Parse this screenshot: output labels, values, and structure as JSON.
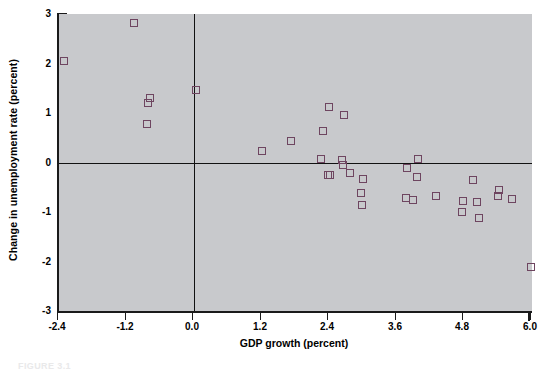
{
  "chart_data": {
    "type": "scatter",
    "title": "",
    "xlabel": "GDP growth (percent)",
    "ylabel": "Change in unemployment rate (percent)",
    "xlim": [
      -2.4,
      6.0
    ],
    "ylim": [
      -3,
      3
    ],
    "xticks": [
      "-2.4",
      "-1.2",
      "0.0",
      "1.2",
      "2.4",
      "3.6",
      "4.8",
      "6.0"
    ],
    "xtick_values": [
      -2.4,
      -1.2,
      0.0,
      1.2,
      2.4,
      3.6,
      4.8,
      6.0
    ],
    "yticks": [
      "3",
      "2",
      "1",
      "0",
      "-1",
      "-2",
      "-3"
    ],
    "ytick_values": [
      3,
      2,
      1,
      0,
      -1,
      -2,
      -3
    ],
    "grid": false,
    "legend": null,
    "marker_style": "open-square",
    "marker_color": "#6e4560",
    "plot_background": "#c8c9cc",
    "reference_lines": [
      {
        "axis": "y",
        "value": 0
      },
      {
        "axis": "x",
        "value": 0
      }
    ],
    "points": [
      {
        "x": -2.32,
        "y": 2.06
      },
      {
        "x": -1.06,
        "y": 2.82
      },
      {
        "x": -0.78,
        "y": 1.3
      },
      {
        "x": -0.82,
        "y": 1.21
      },
      {
        "x": -0.83,
        "y": 0.77
      },
      {
        "x": 0.03,
        "y": 1.47
      },
      {
        "x": 1.2,
        "y": 0.24
      },
      {
        "x": 1.72,
        "y": 0.43
      },
      {
        "x": 2.28,
        "y": 0.64
      },
      {
        "x": 2.4,
        "y": 1.13
      },
      {
        "x": 2.66,
        "y": 0.95
      },
      {
        "x": 2.26,
        "y": 0.07
      },
      {
        "x": 2.38,
        "y": -0.25
      },
      {
        "x": 2.42,
        "y": -0.26
      },
      {
        "x": 2.62,
        "y": 0.06
      },
      {
        "x": 2.64,
        "y": -0.06
      },
      {
        "x": 2.76,
        "y": -0.21
      },
      {
        "x": 2.99,
        "y": -0.34
      },
      {
        "x": 2.96,
        "y": -0.62
      },
      {
        "x": 2.98,
        "y": -0.85
      },
      {
        "x": 3.78,
        "y": -0.12
      },
      {
        "x": 3.98,
        "y": 0.07
      },
      {
        "x": 3.96,
        "y": -0.3
      },
      {
        "x": 3.76,
        "y": -0.71
      },
      {
        "x": 3.88,
        "y": -0.76
      },
      {
        "x": 4.3,
        "y": -0.68
      },
      {
        "x": 4.78,
        "y": -0.78
      },
      {
        "x": 4.76,
        "y": -0.99
      },
      {
        "x": 4.96,
        "y": -0.36
      },
      {
        "x": 5.02,
        "y": -0.79
      },
      {
        "x": 5.06,
        "y": -1.12
      },
      {
        "x": 5.42,
        "y": -0.55
      },
      {
        "x": 5.4,
        "y": -0.68
      },
      {
        "x": 5.64,
        "y": -0.73
      },
      {
        "x": 5.98,
        "y": -2.12
      }
    ]
  },
  "caption": {
    "text": "FIGURE 3.1"
  }
}
